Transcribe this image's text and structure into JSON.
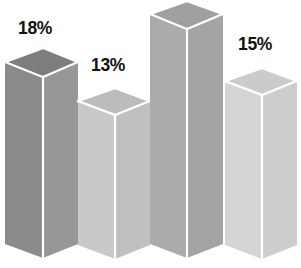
{
  "chart_data": {
    "type": "bar",
    "title": "",
    "subtitle": "",
    "xlabel": "",
    "ylabel": "",
    "grid": false,
    "legend": null,
    "axis_visible": false,
    "style": "3d-isometric-column",
    "background_color": "#ffffff",
    "label_color": "#121212",
    "categories": [
      "Bar 1",
      "Bar 2",
      "Bar 3",
      "Bar 4"
    ],
    "values": [
      18,
      13,
      22,
      15
    ],
    "value_suffix": "%",
    "bars": [
      {
        "index": 0,
        "label": "18%",
        "value": 18,
        "label_visible": true,
        "top_face_color": "#7d7d7d",
        "left_face_color": "#8a8a8a",
        "right_face_color": "#979797",
        "geometry": {
          "left_x": 5,
          "right_x": 78,
          "mid_x": 43,
          "top_apex_y": 48,
          "top_side_y": 62,
          "top_front_y": 77,
          "bottom_side_y": 244,
          "bottom_front_y": 258
        },
        "label_pos": {
          "x": 18,
          "y": 20
        }
      },
      {
        "index": 1,
        "label": "13%",
        "value": 13,
        "label_visible": true,
        "top_face_color": "#bcbcbc",
        "left_face_color": "#c9c9c9",
        "right_face_color": "#c0c0c0",
        "geometry": {
          "left_x": 78,
          "right_x": 150,
          "mid_x": 115,
          "top_apex_y": 88,
          "top_side_y": 101,
          "top_front_y": 115,
          "bottom_side_y": 245,
          "bottom_front_y": 259
        },
        "label_pos": {
          "x": 91,
          "y": 57
        }
      },
      {
        "index": 2,
        "label": "",
        "value": 22,
        "label_visible": false,
        "top_face_color": "#a0a0a0",
        "left_face_color": "#ababab",
        "right_face_color": "#a4a4a4",
        "geometry": {
          "left_x": 150,
          "right_x": 223,
          "mid_x": 187,
          "top_apex_y": 1,
          "top_side_y": 14,
          "top_front_y": 29,
          "bottom_side_y": 244,
          "bottom_front_y": 258
        },
        "label_pos": {
          "x": 163,
          "y": -30
        }
      },
      {
        "index": 3,
        "label": "15%",
        "value": 15,
        "label_visible": true,
        "top_face_color": "#cbcbcb",
        "left_face_color": "#d4d4d4",
        "right_face_color": "#cdcdcd",
        "geometry": {
          "left_x": 225,
          "right_x": 297,
          "mid_x": 262,
          "top_apex_y": 68,
          "top_side_y": 81,
          "top_front_y": 95,
          "bottom_side_y": 245,
          "bottom_front_y": 259
        },
        "label_pos": {
          "x": 238,
          "y": 36
        }
      }
    ]
  }
}
